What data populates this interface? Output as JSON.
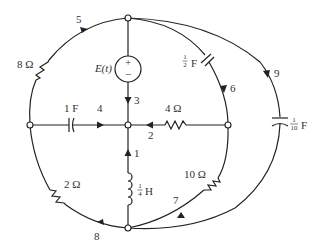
{
  "diagram": {
    "type": "electrical-circuit-graph",
    "nodes": [
      "top",
      "left",
      "center",
      "right",
      "bottom"
    ],
    "source": {
      "label": "E(t)",
      "plus": "+",
      "minus": "−"
    },
    "branches": [
      {
        "id": "1",
        "element": "inductor",
        "value": "H",
        "frac_num": "1",
        "frac_den": "4",
        "from": "bottom",
        "to": "center"
      },
      {
        "id": "2",
        "element": "resistor",
        "value": "4 Ω",
        "from": "right",
        "to": "center"
      },
      {
        "id": "3",
        "element": "voltage-source",
        "value": "E(t)",
        "from": "top",
        "to": "center"
      },
      {
        "id": "4",
        "element": "capacitor",
        "value": "1 F",
        "from": "left",
        "to": "center"
      },
      {
        "id": "5",
        "element": "resistor",
        "value": "8 Ω",
        "from": "left",
        "to": "top"
      },
      {
        "id": "6",
        "element": "capacitor",
        "value": "F",
        "frac_num": "1",
        "frac_den": "2",
        "from": "top",
        "to": "right"
      },
      {
        "id": "7",
        "element": "resistor",
        "value": "10 Ω",
        "from": "right",
        "to": "bottom"
      },
      {
        "id": "8",
        "element": "resistor",
        "value": "2 Ω",
        "from": "bottom",
        "to": "left"
      },
      {
        "id": "9",
        "element": "capacitor",
        "value": "F",
        "frac_num": "1",
        "frac_den": "10",
        "from": "top",
        "to": "bottom"
      }
    ]
  },
  "labels": {
    "b1": "1",
    "b2": "2",
    "b3": "3",
    "b4": "4",
    "b5": "5",
    "b6": "6",
    "b7": "7",
    "b8": "8",
    "b9": "9",
    "r8": "8 Ω",
    "r4": "4 Ω",
    "r10": "10 Ω",
    "r2": "2 Ω",
    "c1": "1 F",
    "c_half_num": "1",
    "c_half_den": "2",
    "c_half_unit": "F",
    "c_tenth_num": "1",
    "c_tenth_den": "10",
    "c_tenth_unit": "F",
    "l_num": "1",
    "l_den": "4",
    "l_unit": "H",
    "source": "E(t)",
    "plus": "+",
    "minus": "−"
  }
}
